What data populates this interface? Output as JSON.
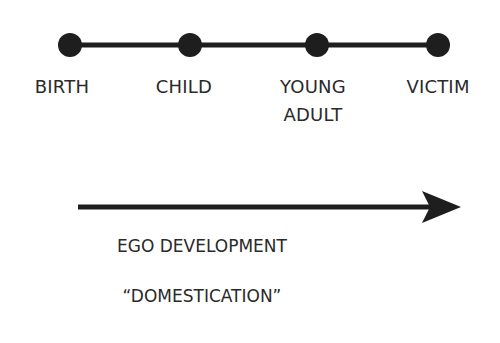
{
  "timeline": {
    "stages": [
      {
        "label_line1": "BIRTH",
        "label_line2": "",
        "x": 70
      },
      {
        "label_line1": "CHILD",
        "label_line2": "",
        "x": 190
      },
      {
        "label_line1": "YOUNG",
        "label_line2": "ADULT",
        "x": 317
      },
      {
        "label_line1": "VICTIM",
        "label_line2": "",
        "x": 438
      }
    ],
    "line_color": "#1e1e1e"
  },
  "arrow": {
    "caption_line1": "EGO DEVELOPMENT",
    "caption_line2": "“DOMESTICATION”",
    "color": "#1e1e1e"
  }
}
